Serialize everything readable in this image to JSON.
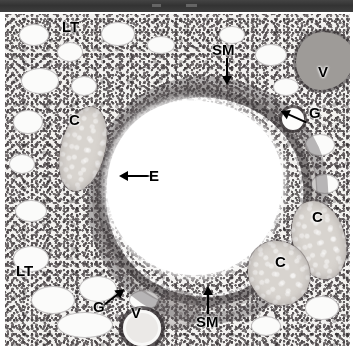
{
  "topbar": {
    "name": "header-bar",
    "color": "#3a3a3a"
  },
  "figure": {
    "kind": "histology-micrograph",
    "stain": "H&E",
    "background": "#f4f3f1"
  },
  "labels": [
    {
      "id": "lt-top",
      "text": "LT",
      "x": 62,
      "y": 23,
      "size": 15,
      "meaning": "lung tissue"
    },
    {
      "id": "sm-top",
      "text": "SM",
      "x": 212,
      "y": 44,
      "size": 15,
      "meaning": "smooth muscle"
    },
    {
      "id": "v-right",
      "text": "V",
      "x": 318,
      "y": 66,
      "size": 15,
      "meaning": "vessel"
    },
    {
      "id": "g-right",
      "text": "G",
      "x": 309,
      "y": 105,
      "size": 15,
      "meaning": "gland"
    },
    {
      "id": "c-left",
      "text": "C",
      "x": 69,
      "y": 114,
      "size": 15,
      "meaning": "cartilage"
    },
    {
      "id": "e-left",
      "text": "E",
      "x": 149,
      "y": 168,
      "size": 15,
      "meaning": "epithelium"
    },
    {
      "id": "c-right-1",
      "text": "C",
      "x": 312,
      "y": 209,
      "size": 15,
      "meaning": "cartilage"
    },
    {
      "id": "c-right-2",
      "text": "C",
      "x": 275,
      "y": 254,
      "size": 15,
      "meaning": "cartilage"
    },
    {
      "id": "lt-bottom",
      "text": "LT",
      "x": 16,
      "y": 263,
      "size": 15,
      "meaning": "lung tissue"
    },
    {
      "id": "g-bottom",
      "text": "G",
      "x": 93,
      "y": 299,
      "size": 15,
      "meaning": "gland"
    },
    {
      "id": "v-bottom",
      "text": "V",
      "x": 129,
      "y": 305,
      "size": 15,
      "meaning": "vessel"
    },
    {
      "id": "sm-bottom",
      "text": "SM",
      "x": 196,
      "y": 314,
      "size": 15,
      "meaning": "smooth muscle"
    }
  ],
  "arrows": [
    {
      "id": "arrow-sm-top",
      "from": [
        222,
        58
      ],
      "to": [
        222,
        81
      ],
      "direction": "down"
    },
    {
      "id": "arrow-g-right",
      "from": [
        307,
        112
      ],
      "to": [
        288,
        120
      ],
      "direction": "down-left"
    },
    {
      "id": "arrow-e-left",
      "from": [
        146,
        176
      ],
      "to": [
        122,
        176
      ],
      "direction": "left"
    },
    {
      "id": "arrow-g-bottom",
      "from": [
        104,
        303
      ],
      "to": [
        128,
        283
      ],
      "direction": "up-right"
    },
    {
      "id": "arrow-sm-bottom",
      "from": [
        205,
        310
      ],
      "to": [
        205,
        288
      ],
      "direction": "up"
    }
  ],
  "legend_key": {
    "LT": "lung tissue",
    "SM": "smooth muscle",
    "V": "vessel",
    "G": "gland",
    "C": "cartilage",
    "E": "epithelium"
  }
}
